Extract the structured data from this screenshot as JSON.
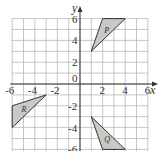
{
  "diagram": {
    "title": "",
    "x_axis_label": "x",
    "y_axis_label": "y",
    "origin_label": "0",
    "range": {
      "xmin": -6,
      "xmax": 6,
      "ymin": -6,
      "ymax": 6
    },
    "x_tick_labels": [
      "-6",
      "-4",
      "-2",
      "2",
      "4",
      "6"
    ],
    "y_tick_labels": [
      "6",
      "4",
      "2",
      "-2",
      "-4",
      "-6"
    ],
    "fill_color": "#c8c8c8",
    "shapes": [
      {
        "label": "P",
        "vertices": [
          [
            1,
            3
          ],
          [
            2,
            6
          ],
          [
            4,
            6
          ]
        ]
      },
      {
        "label": "Q",
        "vertices": [
          [
            1,
            -3
          ],
          [
            2,
            -6
          ],
          [
            4,
            -6
          ]
        ]
      },
      {
        "label": "R",
        "vertices": [
          [
            -6,
            -2
          ],
          [
            -6,
            -4
          ],
          [
            -3,
            -1
          ]
        ]
      }
    ]
  }
}
